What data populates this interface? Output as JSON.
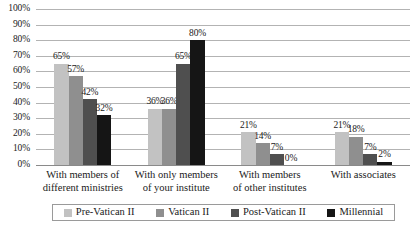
{
  "chart_data": {
    "type": "bar",
    "title": "",
    "subtitle": "",
    "xlabel": "",
    "ylabel": "",
    "ylim": [
      0,
      100
    ],
    "grid": true,
    "legend_position": "bottom",
    "value_suffix": "%",
    "categories": [
      "With members of different ministries",
      "With only members of your institute",
      "With members of other institutes",
      "With associates"
    ],
    "category_lines": [
      [
        "With members of",
        "different ministries"
      ],
      [
        "With only members",
        "of your institute"
      ],
      [
        "With members",
        "of other institutes"
      ],
      [
        "With associates",
        ""
      ]
    ],
    "yticks": [
      0,
      10,
      20,
      30,
      40,
      50,
      60,
      70,
      80,
      90,
      100
    ],
    "ytick_labels": [
      "0%",
      "10%",
      "20%",
      "30%",
      "40%",
      "50%",
      "60%",
      "70%",
      "80%",
      "90%",
      "100%"
    ],
    "series": [
      {
        "name": "Pre-Vatican II",
        "color": "#c2c2c2",
        "values": [
          65,
          36,
          21,
          21
        ],
        "labels": [
          "65%",
          "36%",
          "21%",
          "21%"
        ]
      },
      {
        "name": "Vatican II",
        "color": "#8f8f8f",
        "values": [
          57,
          36,
          14,
          18
        ],
        "labels": [
          "57%",
          "36%",
          "14%",
          "18%"
        ]
      },
      {
        "name": "Post-Vatican II",
        "color": "#4f4f4f",
        "values": [
          42,
          65,
          7,
          7
        ],
        "labels": [
          "42%",
          "65%",
          "7%",
          "7%"
        ]
      },
      {
        "name": "Millennial",
        "color": "#151515",
        "values": [
          32,
          80,
          0,
          2
        ],
        "labels": [
          "32%",
          "80%",
          "0%",
          "2%"
        ]
      }
    ]
  },
  "colors": {
    "gridline": "#b3b3b3",
    "axis": "#8a8a8a",
    "legend_border": "#9a9a9a",
    "background": "#ffffff",
    "text": "#1a1a1a"
  }
}
